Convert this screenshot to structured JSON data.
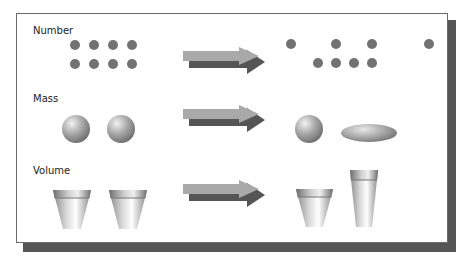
{
  "diagram": {
    "rows": [
      {
        "label": "Number",
        "before": {
          "shape": "dots",
          "count": 8,
          "arrangement": "two rows of four, evenly spaced"
        },
        "after": {
          "shape": "dots",
          "count": 8,
          "arrangement": "top row spread out, bottom row clustered"
        }
      },
      {
        "label": "Mass",
        "before": {
          "shape": "spheres",
          "count": 2
        },
        "after": {
          "shape": "sphere and flattened ellipse",
          "count": 2
        }
      },
      {
        "label": "Volume",
        "before": {
          "shape": "cups",
          "count": 2,
          "description": "two identical short cups"
        },
        "after": {
          "shape": "cups",
          "count": 2,
          "description": "one short wide cup and one tall narrow cup"
        }
      }
    ],
    "arrow_icon": "right-arrow-icon",
    "colors": {
      "dot": "#727272",
      "arrow_light": "#a9a9a9",
      "arrow_dark": "#555555",
      "frame_border": "#6a6a6a",
      "frame_shadow": "#555555"
    }
  }
}
